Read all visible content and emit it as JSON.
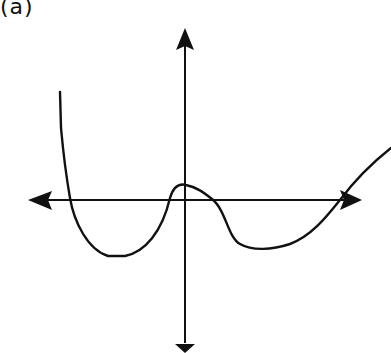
{
  "figure": {
    "label": "(a)",
    "colors": {
      "ink": "#111111",
      "background": "#ffffff"
    }
  },
  "axes": {
    "x_axis": {
      "has_left_arrow": true,
      "has_right_arrow": true
    },
    "y_axis": {
      "has_up_arrow": true,
      "has_down_arrow": true
    }
  },
  "curve": {
    "x_intercepts_count": 4,
    "features": [
      "falls steeply from upper-left",
      "crosses x-axis, local minimum left of y-axis",
      "rises to small local maximum just above origin",
      "crosses x-axis, local minimum right of y-axis",
      "rises and exits upper-right"
    ]
  }
}
